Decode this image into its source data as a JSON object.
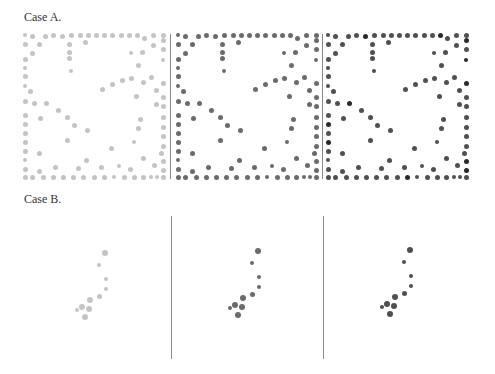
{
  "figure": {
    "case_a": {
      "label": "Case A."
    },
    "case_b": {
      "label": "Case B."
    }
  },
  "colors": {
    "light": "#c4c4c4",
    "medium": "#6b6b6b",
    "dark": "#505050",
    "darkest": "#2a2a2a",
    "divider": "#8a8a8a"
  },
  "chart_data": [
    {
      "type": "scatter",
      "title": "Case A.",
      "panels": [
        {
          "name": "A1",
          "shade": "light gray",
          "origin": [
            25,
            35
          ]
        },
        {
          "name": "A2",
          "shade": "dark gray",
          "origin": [
            178,
            35
          ]
        },
        {
          "name": "A3",
          "shade": "dark gray, some darker",
          "origin": [
            328,
            35
          ]
        }
      ],
      "points_relative": [
        [
          0,
          0,
          2
        ],
        [
          7,
          1,
          2.5
        ],
        [
          20,
          1,
          2.5
        ],
        [
          28,
          0,
          2.5
        ],
        [
          37,
          1,
          2.5
        ],
        [
          46,
          0,
          2.5
        ],
        [
          55,
          0,
          2.5
        ],
        [
          63,
          0,
          2.5
        ],
        [
          71,
          0,
          2.5
        ],
        [
          79,
          0,
          2.5
        ],
        [
          87,
          0,
          2.5
        ],
        [
          96,
          0,
          2.5
        ],
        [
          104,
          0,
          2.5
        ],
        [
          112,
          0,
          2.5
        ],
        [
          119,
          3,
          2.5
        ],
        [
          128,
          0,
          2.5
        ],
        [
          138,
          0,
          2.5
        ],
        [
          0,
          9,
          2.5
        ],
        [
          14,
          9,
          2.5
        ],
        [
          44,
          9,
          2.5
        ],
        [
          60,
          7,
          2.5
        ],
        [
          128,
          10,
          2.5
        ],
        [
          138,
          5,
          2.5
        ],
        [
          7,
          18,
          2.5
        ],
        [
          44,
          17,
          2.5
        ],
        [
          106,
          18,
          2
        ],
        [
          117,
          17,
          2.5
        ],
        [
          138,
          14,
          2.5
        ],
        [
          0,
          24,
          2.5
        ],
        [
          44,
          23,
          2.5
        ],
        [
          113,
          30,
          2.5
        ],
        [
          138,
          25,
          2
        ],
        [
          0,
          33,
          2
        ],
        [
          46,
          36,
          2
        ],
        [
          126,
          42,
          2.5
        ],
        [
          0,
          41,
          2.5
        ],
        [
          97,
          45,
          2.5
        ],
        [
          87,
          49,
          2.5
        ],
        [
          106,
          43,
          2.5
        ],
        [
          118,
          47,
          2.5
        ],
        [
          138,
          48,
          2.5
        ],
        [
          0,
          51,
          2
        ],
        [
          77,
          54,
          2.5
        ],
        [
          131,
          55,
          2.5
        ],
        [
          5,
          56,
          2.5
        ],
        [
          111,
          61,
          2.5
        ],
        [
          138,
          62,
          2.5
        ],
        [
          0,
          66,
          2.5
        ],
        [
          9,
          68,
          2.5
        ],
        [
          21,
          68,
          2.5
        ],
        [
          33,
          75,
          2.5
        ],
        [
          131,
          69,
          2.5
        ],
        [
          138,
          71,
          2.5
        ],
        [
          0,
          80,
          2.5
        ],
        [
          15,
          83,
          2.5
        ],
        [
          42,
          82,
          2.5
        ],
        [
          115,
          84,
          2.5
        ],
        [
          138,
          82,
          2.5
        ],
        [
          0,
          89,
          2.5
        ],
        [
          49,
          90,
          2.5
        ],
        [
          62,
          95,
          2.5
        ],
        [
          113,
          93,
          2.5
        ],
        [
          138,
          92,
          2.5
        ],
        [
          0,
          98,
          2.5
        ],
        [
          42,
          105,
          2.5
        ],
        [
          109,
          107,
          2
        ],
        [
          138,
          101,
          2.5
        ],
        [
          0,
          107,
          2.5
        ],
        [
          138,
          111,
          2.5
        ],
        [
          0,
          116,
          2.5
        ],
        [
          14,
          118,
          2.5
        ],
        [
          86,
          113,
          2.5
        ],
        [
          136,
          118,
          2.5
        ],
        [
          0,
          125,
          2
        ],
        [
          61,
          125,
          2.5
        ],
        [
          118,
          123,
          2.5
        ],
        [
          138,
          126,
          2.5
        ],
        [
          0,
          134,
          2.5
        ],
        [
          14,
          136,
          2.5
        ],
        [
          30,
          132,
          2.5
        ],
        [
          53,
          133,
          2.5
        ],
        [
          94,
          131,
          2
        ],
        [
          76,
          132,
          2.5
        ],
        [
          105,
          134,
          2.5
        ],
        [
          129,
          130,
          2.5
        ],
        [
          138,
          135,
          2.5
        ],
        [
          0,
          142,
          2.5
        ],
        [
          7,
          142,
          2.5
        ],
        [
          18,
          142,
          2.5
        ],
        [
          28,
          142,
          2.5
        ],
        [
          38,
          142,
          2.5
        ],
        [
          48,
          142,
          2.5
        ],
        [
          58,
          142,
          2.5
        ],
        [
          69,
          142,
          2.5
        ],
        [
          79,
          142,
          2.5
        ],
        [
          89,
          142,
          2
        ],
        [
          99,
          142,
          2.5
        ],
        [
          109,
          142,
          2.5
        ],
        [
          118,
          142,
          2.5
        ],
        [
          126,
          142,
          2
        ],
        [
          132,
          142,
          2
        ],
        [
          138,
          142,
          2.5
        ]
      ]
    },
    {
      "type": "scatter",
      "title": "Case B.",
      "panels": [
        {
          "name": "B1",
          "shade": "light gray",
          "origin": [
            0,
            0
          ]
        },
        {
          "name": "B2",
          "shade": "dark gray",
          "origin": [
            153,
            -2
          ]
        },
        {
          "name": "B3",
          "shade": "dark gray",
          "origin": [
            305,
            -3
          ]
        }
      ],
      "points_absolute_B1": [
        [
          105,
          253,
          3
        ],
        [
          99,
          265,
          2
        ],
        [
          106,
          279,
          2
        ],
        [
          106,
          289,
          2
        ],
        [
          99,
          296,
          2.5
        ],
        [
          90,
          300,
          3
        ],
        [
          82,
          307,
          3
        ],
        [
          89,
          309,
          3
        ],
        [
          77,
          310,
          2
        ],
        [
          85,
          317,
          3
        ]
      ]
    }
  ]
}
